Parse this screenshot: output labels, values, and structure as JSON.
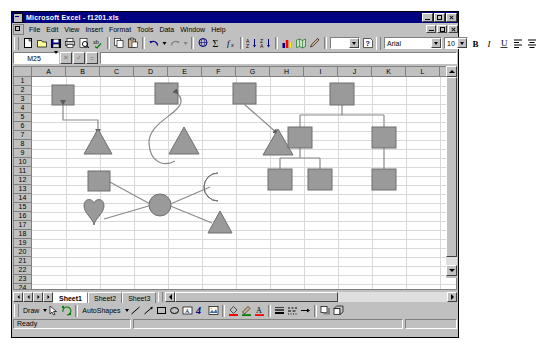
{
  "window": {
    "app_title": "Microsoft Excel - f1201.xls",
    "doc_title": "f1201.xls",
    "app_icon": "excel-icon",
    "buttons": {
      "minimize": "_",
      "restore": "□",
      "close": "×"
    }
  },
  "menu": {
    "items": [
      "File",
      "Edit",
      "View",
      "Insert",
      "Format",
      "Tools",
      "Data",
      "Window",
      "Help"
    ]
  },
  "standard_toolbar": {
    "buttons": [
      "new-icon",
      "open-icon",
      "save-icon",
      "print-icon",
      "print-preview-icon",
      "spelling-icon",
      "copy-icon",
      "paste-icon",
      "undo-icon",
      "undo-dropdown-icon",
      "redo-icon",
      "redo-dropdown-icon",
      "hyperlink-icon",
      "autosum-icon",
      "function-wizard-icon",
      "sort-asc-icon",
      "sort-desc-icon",
      "chart-wizard-icon",
      "map-icon",
      "drawing-icon",
      "zoom-box-icon",
      "help-icon"
    ]
  },
  "formatting_toolbar": {
    "font_name": "Arial",
    "font_size": "10",
    "buttons": [
      "bold-icon",
      "italic-icon",
      "underline-icon",
      "align-left-icon",
      "align-center-icon"
    ]
  },
  "formula_bar": {
    "name_box_value": "M25",
    "cancel_label": "✕",
    "enter_label": "✓",
    "function_label": "=",
    "formula_value": ""
  },
  "worksheet": {
    "columns": [
      "A",
      "B",
      "C",
      "D",
      "E",
      "F",
      "G",
      "H",
      "I",
      "J",
      "K",
      "L"
    ],
    "rows": [
      "1",
      "2",
      "3",
      "4",
      "5",
      "6",
      "7",
      "8",
      "9",
      "10",
      "11",
      "12",
      "13",
      "14",
      "15",
      "16",
      "17",
      "18",
      "19",
      "20",
      "21",
      "22",
      "23",
      "24",
      "25"
    ],
    "active_cell": "M25",
    "gridline_color": "#d9d9d9",
    "shape_fill": "#999999",
    "shape_stroke": "#666666",
    "connector_color": "#808080"
  },
  "drawing_canvas": {
    "description": "Three connector demonstrations (elbow, curved, straight) joining a square to a triangle; an organization-chart tree of six squares; and a hub diagram with a central circle linked to a square, heart, moon and triangle.",
    "groups": [
      {
        "name": "elbow-connector-demo",
        "shapes": [
          "square",
          "triangle"
        ],
        "connector": "elbow-arrow"
      },
      {
        "name": "curved-connector-demo",
        "shapes": [
          "square",
          "triangle"
        ],
        "connector": "curved-arrow"
      },
      {
        "name": "straight-connector-demo",
        "shapes": [
          "square",
          "triangle"
        ],
        "connector": "straight-arrow"
      },
      {
        "name": "org-chart-tree",
        "shapes": [
          "square",
          "square",
          "square",
          "square",
          "square",
          "square"
        ],
        "connector": "elbow"
      },
      {
        "name": "hub-diagram",
        "shapes": [
          "square",
          "heart",
          "circle",
          "moon",
          "triangle"
        ],
        "connector": "straight"
      }
    ]
  },
  "sheet_tabs": {
    "nav": [
      "first-tab-icon",
      "prev-tab-icon",
      "next-tab-icon",
      "last-tab-icon"
    ],
    "tabs": [
      "Sheet1",
      "Sheet2",
      "Sheet3"
    ],
    "active": "Sheet1"
  },
  "drawing_toolbar": {
    "draw_label": "Draw",
    "autoshapes_label": "AutoShapes",
    "buttons": [
      "select-objects-icon",
      "free-rotate-icon",
      "line-icon",
      "arrow-icon",
      "rectangle-icon",
      "oval-icon",
      "text-box-icon",
      "wordart-icon",
      "clipart-icon",
      "fill-color-icon",
      "line-color-icon",
      "font-color-icon",
      "line-style-icon",
      "dash-style-icon",
      "arrow-style-icon",
      "shadow-icon",
      "3d-icon"
    ]
  },
  "status_bar": {
    "message": "Ready",
    "mode": "",
    "num_lock": ""
  }
}
